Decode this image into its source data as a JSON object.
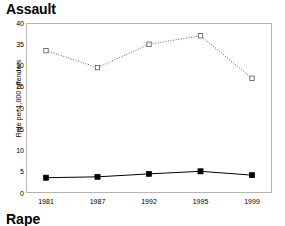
{
  "chart_data": {
    "type": "line",
    "title": "Assault",
    "xlabel": "",
    "ylabel": "Rate per 1,000 offenders",
    "categories": [
      "1981",
      "1987",
      "1992",
      "1995",
      "1999"
    ],
    "x": [
      1981,
      1987,
      1992,
      1995,
      1999
    ],
    "ylim": [
      0,
      40
    ],
    "yticks": [
      0,
      5,
      10,
      15,
      20,
      25,
      30,
      35,
      40
    ],
    "ytick_labels": [
      "0",
      "5",
      "10",
      "15",
      "20",
      "25",
      "30",
      "35",
      "40"
    ],
    "grid": false,
    "legend": "none",
    "series": [
      {
        "name": "upper-series",
        "values": [
          33.5,
          29.5,
          35.0,
          37.0,
          27.0
        ],
        "line_style": "dotted",
        "marker": "open-square",
        "color": "#555555"
      },
      {
        "name": "lower-series",
        "values": [
          3.6,
          3.8,
          4.5,
          5.1,
          4.2
        ],
        "line_style": "solid",
        "marker": "filled-square",
        "color": "#000000"
      }
    ]
  },
  "figure": {
    "title": "Assault",
    "next_section_title": "Rape",
    "frame_color": "#b4b4b4",
    "background": "#ffffff"
  }
}
